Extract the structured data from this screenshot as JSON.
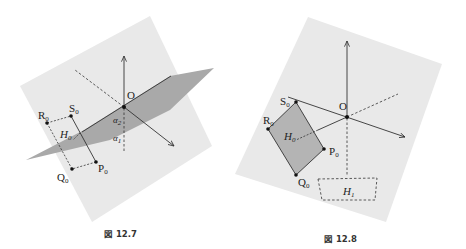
{
  "figures": [
    {
      "id": "fig-12-7",
      "caption": "図 12.7",
      "colors": {
        "plane_light": "#e9e9e9",
        "plane_dark": "#a9a9a9",
        "stroke": "#333333"
      },
      "labels": {
        "origin": "O",
        "R": "R",
        "R_sub": "0",
        "S": "S",
        "S_sub": "0",
        "P": "P",
        "P_sub": "0",
        "Q": "Q",
        "Q_sub": "0",
        "H": "H",
        "H_sub": "0",
        "alpha2": "α",
        "alpha2_sub": "2",
        "alpha1": "α",
        "alpha1_sub": "1"
      }
    },
    {
      "id": "fig-12-8",
      "caption": "図 12.8",
      "colors": {
        "plane_light": "#e9e9e9",
        "quad_fill": "#b4b4b4",
        "stroke": "#333333"
      },
      "labels": {
        "origin": "O",
        "R": "R",
        "R_sub": "0",
        "S": "S",
        "S_sub": "0",
        "P": "P",
        "P_sub": "0",
        "Q": "Q",
        "Q_sub": "0",
        "H0": "H",
        "H0_sub": "0",
        "H1": "H",
        "H1_sub": "1"
      }
    }
  ]
}
